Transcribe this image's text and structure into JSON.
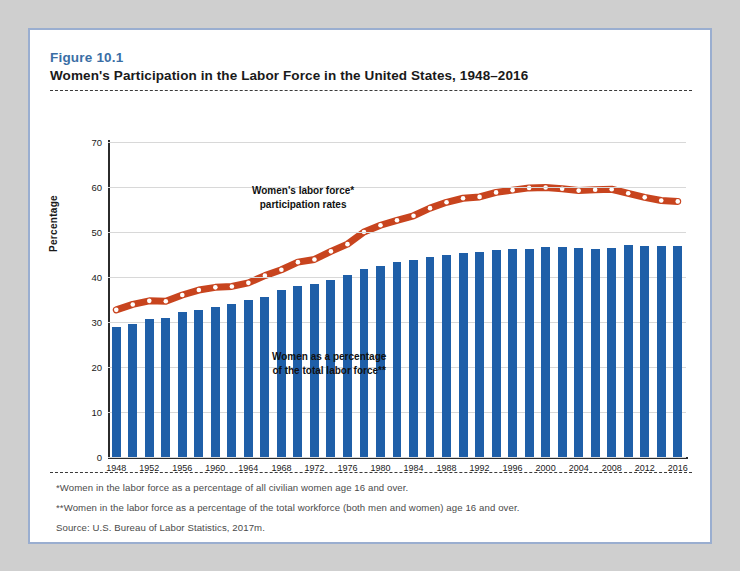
{
  "figure": {
    "label": "Figure 10.1",
    "title": "Women's Participation in the Labor Force in the United States, 1948–2016"
  },
  "notes": [
    "*Women in the labor force as a percentage of all civilian women age 16 and over.",
    "**Women in the labor force as a percentage of the total workforce (both men and women) age 16 and over.",
    "Source:  U.S. Bureau of Labor Statistics, 2017m."
  ],
  "colors": {
    "bar": "#1f5fa8",
    "line": "#c8441e",
    "marker": "#ffffff",
    "figure_label": "#3a6ea5",
    "card_border": "#9aaed0",
    "grid": "#d8d8d8",
    "axis": "#2b2b2b",
    "page_background": "#cfcfcf"
  },
  "annotations": {
    "line_label_1": "Women's labor force*",
    "line_label_2": "participation rates",
    "bar_label_1": "Women as a percentage",
    "bar_label_2": "of the total labor force**"
  },
  "chart_data": {
    "type": "bar",
    "title": "Women's Participation in the Labor Force in the United States, 1948–2016",
    "xlabel": "",
    "ylabel": "Percentage",
    "ylim": [
      0,
      70
    ],
    "ytick_step": 10,
    "yticks": [
      0,
      10,
      20,
      30,
      40,
      50,
      60,
      70
    ],
    "grid": true,
    "legend_position": "inline-annotations",
    "xtick_labels": [
      "1948",
      "1952",
      "1956",
      "1960",
      "1964",
      "1968",
      "1972",
      "1976",
      "1980",
      "1984",
      "1988",
      "1992",
      "1996",
      "2000",
      "2004",
      "2008",
      "2012",
      "2016"
    ],
    "categories": [
      1948,
      1950,
      1952,
      1954,
      1956,
      1958,
      1960,
      1962,
      1964,
      1966,
      1968,
      1970,
      1972,
      1974,
      1976,
      1978,
      1980,
      1982,
      1984,
      1986,
      1988,
      1990,
      1992,
      1994,
      1996,
      1998,
      2000,
      2002,
      2004,
      2006,
      2008,
      2010,
      2012,
      2014,
      2016
    ],
    "series": [
      {
        "name": "Women as a percentage of the total labor force**",
        "type": "bar",
        "values": [
          28.9,
          29.5,
          30.6,
          30.9,
          32.2,
          32.7,
          33.4,
          34.0,
          34.8,
          35.6,
          37.1,
          38.1,
          38.5,
          39.4,
          40.5,
          41.7,
          42.5,
          43.3,
          43.8,
          44.4,
          45.0,
          45.3,
          45.5,
          46.0,
          46.2,
          46.3,
          46.6,
          46.6,
          46.4,
          46.3,
          46.5,
          47.2,
          47.0,
          46.9,
          46.8
        ]
      },
      {
        "name": "Women's labor force* participation rates",
        "type": "line",
        "values": [
          32.7,
          33.9,
          34.7,
          34.6,
          36.0,
          37.1,
          37.7,
          37.9,
          38.7,
          40.3,
          41.6,
          43.3,
          43.9,
          45.7,
          47.3,
          50.0,
          51.5,
          52.6,
          53.6,
          55.3,
          56.6,
          57.5,
          57.8,
          58.8,
          59.3,
          59.8,
          59.9,
          59.6,
          59.2,
          59.4,
          59.5,
          58.6,
          57.7,
          57.0,
          56.8
        ]
      }
    ]
  }
}
